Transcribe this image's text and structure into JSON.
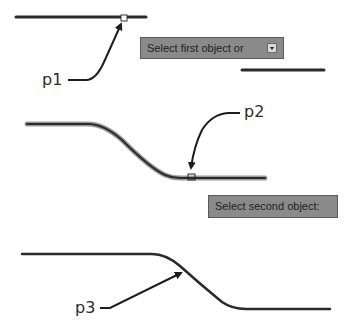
{
  "labels": {
    "p1": "p1",
    "p2": "p2",
    "p3": "p3"
  },
  "tooltips": {
    "first": {
      "text": "Select first object or",
      "icon": "dropdown-arrow-icon"
    },
    "second": {
      "text": "Select second object:"
    }
  },
  "colors": {
    "line": "#2a2a2a",
    "tooltip_bg": "#8a8a8a",
    "tooltip_border": "#5a5a5a",
    "background": "#ffffff"
  }
}
